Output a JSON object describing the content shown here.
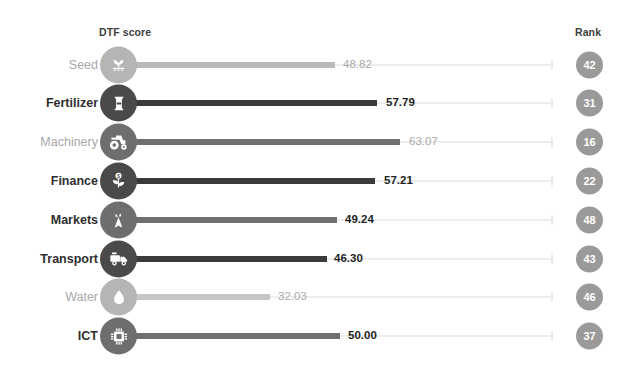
{
  "header": {
    "score_label": "DTF score",
    "rank_label": "Rank"
  },
  "colors": {
    "bar_dark": "#3a3a3a",
    "bar_mid": "#6f6f6f",
    "bar_light": "#b9b9b9",
    "icon_dark": "#4a4a4a",
    "icon_mid": "#6e6e6e",
    "icon_light": "#b5b5b5",
    "rank_bubble": "#9a9a9a",
    "track": "#eeeeee",
    "label_dark": "#2f2f2f",
    "label_light": "#a8a8a8",
    "background": "#ffffff"
  },
  "chart_data": {
    "type": "bar",
    "title": "",
    "xlabel": "DTF score",
    "ylabel": "",
    "xlim": [
      0,
      100
    ],
    "grid": false,
    "orientation": "horizontal",
    "categories": [
      "Seed",
      "Fertilizer",
      "Machinery",
      "Finance",
      "Markets",
      "Transport",
      "Water",
      "ICT"
    ],
    "values": [
      48.82,
      57.79,
      63.07,
      57.21,
      49.24,
      46.3,
      32.03,
      50.0
    ],
    "value_labels": [
      "48.82",
      "57.79",
      "63.07",
      "57.21",
      "49.24",
      "46.30",
      "32.03",
      "50.00"
    ],
    "ranks": [
      42,
      31,
      16,
      22,
      48,
      43,
      46,
      37
    ],
    "series": [
      {
        "name": "DTF score",
        "values": [
          48.82,
          57.79,
          63.07,
          57.21,
          49.24,
          46.3,
          32.03,
          50.0
        ]
      }
    ]
  },
  "rows": [
    {
      "label": "Seed",
      "value": "48.82",
      "rank": "42",
      "icon": "seedling-icon",
      "emphasis": "light",
      "bar_width": 217,
      "value_x": 343
    },
    {
      "label": "Fertilizer",
      "value": "57.79",
      "rank": "31",
      "icon": "fertilizer-bag-icon",
      "emphasis": "dark",
      "bar_width": 259,
      "value_x": 386
    },
    {
      "label": "Machinery",
      "value": "63.07",
      "rank": "16",
      "icon": "tractor-icon",
      "emphasis": "mid",
      "bar_width": 282,
      "value_x": 409
    },
    {
      "label": "Finance",
      "value": "57.21",
      "rank": "22",
      "icon": "money-plant-icon",
      "emphasis": "dark",
      "bar_width": 257,
      "value_x": 384
    },
    {
      "label": "Markets",
      "value": "49.24",
      "rank": "48",
      "icon": "carrot-icon",
      "emphasis": "mid",
      "bar_width": 219,
      "value_x": 345
    },
    {
      "label": "Transport",
      "value": "46.30",
      "rank": "43",
      "icon": "truck-icon",
      "emphasis": "dark",
      "bar_width": 209,
      "value_x": 334
    },
    {
      "label": "Water",
      "value": "32.03",
      "rank": "46",
      "icon": "water-drop-icon",
      "emphasis": "pale",
      "bar_width": 152,
      "value_x": 278
    },
    {
      "label": "ICT",
      "value": "50.00",
      "rank": "37",
      "icon": "microchip-icon",
      "emphasis": "mid",
      "bar_width": 222,
      "value_x": 348
    }
  ]
}
